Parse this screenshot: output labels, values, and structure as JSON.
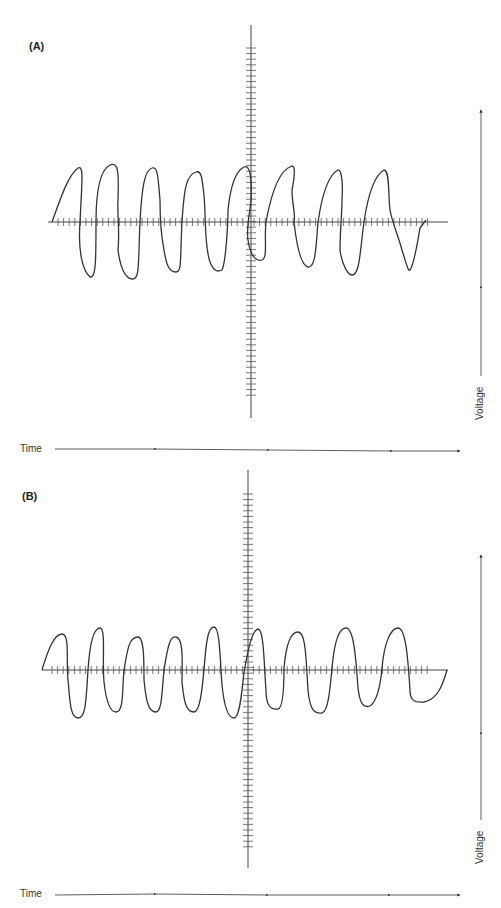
{
  "figure": {
    "panels": [
      {
        "id": "A",
        "label": "(A)",
        "description": "Irregular, jagged oscillating voltage trace",
        "cycles": 9,
        "time_axis_label": "Time",
        "voltage_axis_label": "Voltage"
      },
      {
        "id": "B",
        "label": "(B)",
        "description": "Smooth regular oscillating voltage trace",
        "cycles": 9,
        "time_axis_label": "Time",
        "voltage_axis_label": "Voltage"
      }
    ],
    "colors": {
      "trace": "#333333",
      "axis": "#444444",
      "background": "#ffffff"
    }
  }
}
